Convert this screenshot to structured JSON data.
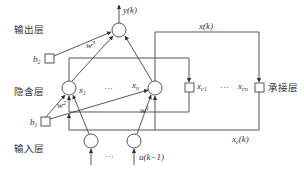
{
  "diagram": {
    "type": "Elman neural network structure",
    "layers": {
      "output": "输出层",
      "hidden": "隐含层",
      "input": "输入层",
      "context": "承接层"
    },
    "labels": {
      "output_signal": "y(k)",
      "hidden_state": "x(k)",
      "context_state": "x",
      "context_state_sub": "c",
      "context_state_arg": "(k)",
      "input_signal": "u(k−1)",
      "ellipsis": "···",
      "x1": "x",
      "x1_sub": "1",
      "xn": "x",
      "xn_sub": "n",
      "xc1": "x",
      "xc1_sub": "c1",
      "xcn": "x",
      "xcn_sub": "cn",
      "b1": "b",
      "b1_sub": "1",
      "b2": "b",
      "b2_sub": "2",
      "w1": "w",
      "w1_sup": "1",
      "w2": "w",
      "w2_sup": "2",
      "w3": "w",
      "w3_sup": "3"
    },
    "colors": {
      "line": "#444444",
      "text": "#333333",
      "background": "#ffffff"
    }
  }
}
